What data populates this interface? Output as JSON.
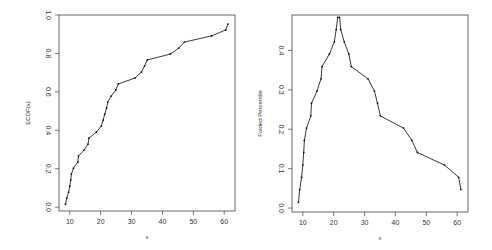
{
  "chart_data": [
    {
      "type": "line",
      "title": "",
      "xlabel": "x",
      "ylabel": "ECDF(x)",
      "xlim": [
        6.5,
        63.5
      ],
      "ylim": [
        -0.02,
        1.0
      ],
      "xticks": [
        10,
        20,
        30,
        40,
        50,
        60
      ],
      "yticks": [
        0.0,
        0.2,
        0.4,
        0.6,
        0.8,
        1.0
      ],
      "ytick_labels": [
        "0.0",
        "0.2",
        "0.4",
        "0.6",
        "0.8",
        "1.0"
      ],
      "grid": false,
      "legend": null,
      "x": [
        8.6,
        9.0,
        9.6,
        10.0,
        10.3,
        10.5,
        11.2,
        12.6,
        12.8,
        14.6,
        15.9,
        16.2,
        18.6,
        20.2,
        20.8,
        21.3,
        21.9,
        22.3,
        23.4,
        24.9,
        25.7,
        31.1,
        33.2,
        34.2,
        35.1,
        42.6,
        45.3,
        47.1,
        55.9,
        60.5,
        61.2
      ],
      "values": [
        0.015,
        0.047,
        0.078,
        0.109,
        0.141,
        0.172,
        0.203,
        0.234,
        0.266,
        0.297,
        0.328,
        0.359,
        0.391,
        0.422,
        0.453,
        0.484,
        0.516,
        0.547,
        0.578,
        0.609,
        0.641,
        0.672,
        0.703,
        0.734,
        0.766,
        0.797,
        0.828,
        0.859,
        0.891,
        0.922,
        0.953
      ],
      "markers": true
    },
    {
      "type": "line",
      "title": "",
      "xlabel": "x",
      "ylabel": "Folded Percentile",
      "xlim": [
        6.5,
        63.5
      ],
      "ylim": [
        -0.01,
        0.49
      ],
      "xticks": [
        10,
        20,
        30,
        40,
        50,
        60
      ],
      "yticks": [
        0.0,
        0.1,
        0.2,
        0.3,
        0.4
      ],
      "ytick_labels": [
        "0.0",
        "0.1",
        "0.2",
        "0.3",
        "0.4"
      ],
      "grid": false,
      "legend": null,
      "x": [
        8.6,
        9.0,
        9.6,
        10.0,
        10.3,
        10.5,
        11.2,
        12.6,
        12.8,
        14.6,
        15.9,
        16.2,
        18.6,
        20.2,
        20.8,
        21.3,
        21.9,
        22.3,
        23.4,
        24.9,
        25.7,
        31.1,
        33.2,
        34.2,
        35.1,
        42.6,
        45.3,
        47.1,
        55.9,
        60.5,
        61.2
      ],
      "values": [
        0.015,
        0.047,
        0.078,
        0.109,
        0.141,
        0.172,
        0.203,
        0.234,
        0.266,
        0.297,
        0.328,
        0.359,
        0.391,
        0.422,
        0.453,
        0.484,
        0.484,
        0.453,
        0.422,
        0.391,
        0.359,
        0.328,
        0.297,
        0.266,
        0.234,
        0.203,
        0.172,
        0.141,
        0.109,
        0.078,
        0.047
      ],
      "markers": true
    }
  ],
  "panels": {
    "left": {
      "ylabel": "ECDF(x)",
      "xlabel": "x"
    },
    "right": {
      "ylabel": "Folded Percentile",
      "xlabel": "x"
    }
  }
}
